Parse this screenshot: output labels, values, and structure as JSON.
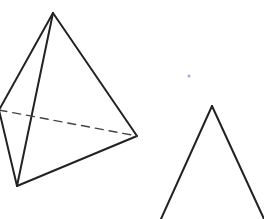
{
  "figure": {
    "width": 264,
    "height": 219,
    "background": "#ffffff",
    "stroke_color": "#222222",
    "dot_color": "#a9a9d8",
    "tetrahedron": {
      "apex": [
        53,
        13
      ],
      "left": [
        -1,
        110
      ],
      "bottom": [
        17,
        186
      ],
      "right": [
        137,
        136
      ],
      "solid_edges": [
        [
          "apex",
          "left"
        ],
        [
          "apex",
          "bottom"
        ],
        [
          "apex",
          "right"
        ],
        [
          "left",
          "bottom"
        ],
        [
          "bottom",
          "right"
        ]
      ],
      "hidden_edges": [
        [
          "left",
          "right"
        ]
      ]
    },
    "cone_outline": {
      "apex": [
        212,
        106
      ],
      "left_base": [
        161,
        219
      ],
      "right_base": [
        264,
        219
      ]
    },
    "dot": [
      189,
      76
    ]
  }
}
